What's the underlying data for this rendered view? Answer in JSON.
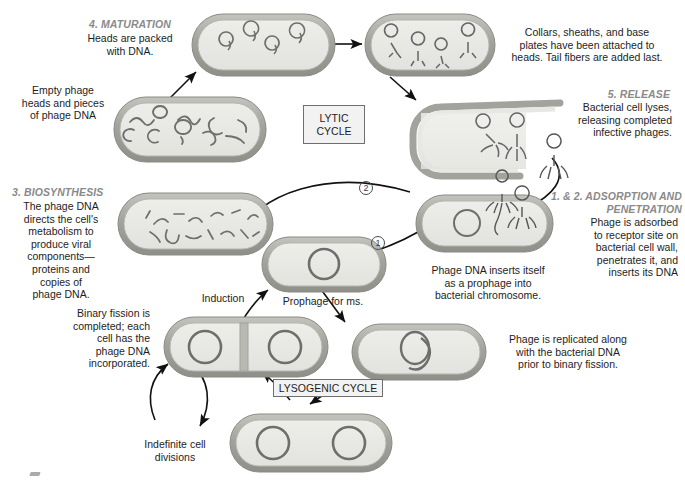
{
  "figure": {
    "background_color": "#ffffff"
  },
  "colors": {
    "cell_wall": "#9a9a96",
    "cell_wall_light": "#c9c9c4",
    "cytoplasm": "#e9e9e6",
    "dna": "#6e6e6c",
    "heading_text": "#8a8a8a",
    "body_text": "#1d1d1d",
    "box_fill": "#f2f2f2",
    "box_border": "#6f6f6f",
    "arrow": "#111111"
  },
  "stage_headings": {
    "maturation": "4. MATURATION",
    "biosynthesis": "3. BIOSYNTHESIS",
    "release": "5. RELEASE",
    "adsorption": "1. & 2. ADSORPTION AND\nPENETRATION"
  },
  "cycle_labels": {
    "lytic": "LYTIC\nCYCLE",
    "lysogenic": "LYSOGENIC CYCLE"
  },
  "step_numbers": {
    "one": "1",
    "two": "2"
  },
  "captions": {
    "maturation": "Heads are packed\nwith DNA.",
    "assembly": "Collars, sheaths, and base\nplates have been attached to\nheads.  Tail fibers are added last.",
    "empty_heads": "Empty phage\nheads and pieces\nof phage DNA",
    "biosynthesis": "The phage DNA\ndirects the cell's\nmetabolism to\nproduce viral\ncomponents—\nproteins and\ncopies of\nphage DNA.",
    "release": "Bacterial cell lyses,\nreleasing completed\ninfective phages.",
    "adsorption": "Phage is adsorbed\nto receptor site on\nbacterial cell wall,\npenetrates it, and\ninserts its DNA",
    "prophage_insert": "Phage DNA inserts itself\nas a prophage into\nbacterial chromosome.",
    "prophage_forms": "Prophage for ms.",
    "induction": "Induction",
    "replication": "Phage is replicated along\nwith the bacterial DNA\nprior to binary fission.",
    "binary_fission": "Binary fission is\ncompleted; each\ncell has the\nphage DNA\nincorporated.",
    "indefinite_divisions": "Indefinite cell\ndivisions"
  },
  "cells": [
    {
      "id": "maturation-cell",
      "label": "bacterium with assembled phage heads packed with DNA",
      "contents": "4 phage heads with DNA"
    },
    {
      "id": "assembly-cell",
      "label": "bacterium with complete phages having tails and fibers",
      "contents": "4 complete phages"
    },
    {
      "id": "empty-heads-cell",
      "label": "bacterium with empty phage heads and DNA pieces",
      "contents": "empty heads and DNA fragments"
    },
    {
      "id": "biosynthesis-cell",
      "label": "bacterium with viral DNA strands being synthesized",
      "contents": "phage DNA strands"
    },
    {
      "id": "lysis-cell",
      "label": "lysing bacterium releasing phages",
      "contents": "2 phages escaping"
    },
    {
      "id": "infection-cell",
      "label": "bacterium being infected by phage at receptor site",
      "contents": "bacterial chromosome"
    },
    {
      "id": "prophage-cell",
      "label": "bacterium with prophage integrated in chromosome",
      "contents": "bacterial chromosome ring"
    },
    {
      "id": "replication-cell",
      "label": "bacterium with replicated chromosome",
      "contents": "double looped chromosome"
    },
    {
      "id": "divided-cell",
      "label": "two daughter cells after binary fission",
      "contents": "two chromosome rings"
    },
    {
      "id": "predivision-cell",
      "label": "bacterium before division with two chromosomes",
      "contents": "two chromosome rings"
    }
  ]
}
